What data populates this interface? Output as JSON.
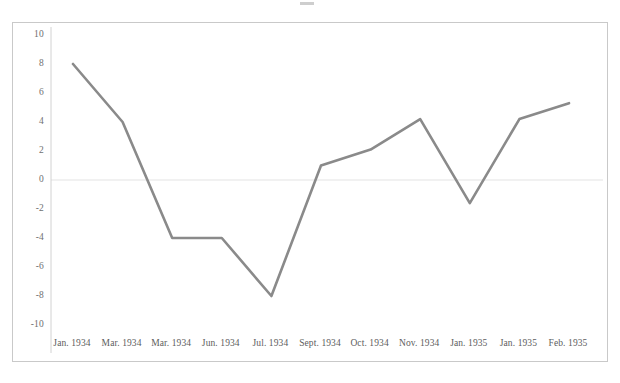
{
  "chart_data": {
    "type": "line",
    "title": "",
    "xlabel": "",
    "ylabel": "",
    "categories": [
      "Jan. 1934",
      "Mar. 1934",
      "Mar. 1934",
      "Jun. 1934",
      "Jul. 1934",
      "Sept. 1934",
      "Oct. 1934",
      "Nov. 1934",
      "Jan. 1935",
      "Jan. 1935",
      "Feb. 1935"
    ],
    "values": [
      8.0,
      4.0,
      -4.0,
      -4.0,
      -8.0,
      1.0,
      2.1,
      4.2,
      -1.6,
      4.2,
      5.3
    ],
    "ylim": [
      -10,
      10
    ],
    "y_ticks": [
      10,
      8,
      6,
      4,
      2,
      0,
      -2,
      -4,
      -6,
      -8,
      -10
    ],
    "y_tick_labels": [
      "10",
      "8",
      "6",
      "4",
      "2",
      "0",
      "-2",
      "-4",
      "-6",
      "-8",
      "-10"
    ],
    "grid": false,
    "zero_line": true,
    "legend": null,
    "series": [
      {
        "name": "series-1",
        "color": "#8a8a8a",
        "values": [
          8.0,
          4.0,
          -4.0,
          -4.0,
          -8.0,
          1.0,
          2.1,
          4.2,
          -1.6,
          4.2,
          5.3
        ]
      }
    ]
  },
  "style": {
    "line_color": "#8a8a8a",
    "frame_color": "#c9c9c9",
    "axis_color": "#d2d2d2",
    "zero_line_color": "#e3e3e3",
    "tick_label_color": "#6f6f6f",
    "background": "#ffffff"
  }
}
